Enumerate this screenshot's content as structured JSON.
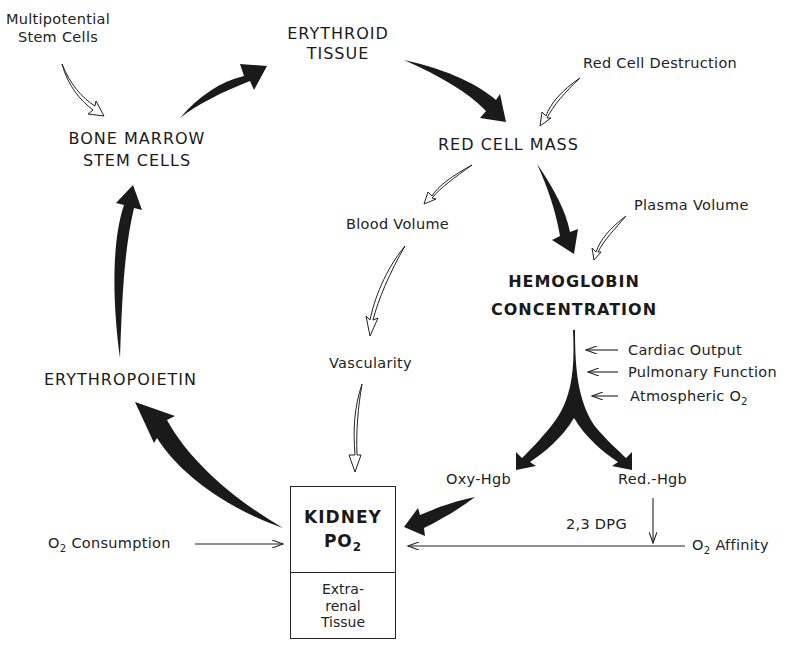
{
  "diagram": {
    "type": "erythropoiesis regulation feedback loop",
    "nodes": {
      "multipotential_stem_cells": [
        "Multipotential",
        "Stem Cells"
      ],
      "erythroid_tissue": [
        "ERYTHROID",
        "TISSUE"
      ],
      "bone_marrow_stem_cells": [
        "BONE MARROW",
        "STEM CELLS"
      ],
      "red_cell_destruction": "Red Cell Destruction",
      "red_cell_mass": "RED CELL MASS",
      "blood_volume": "Blood Volume",
      "plasma_volume": "Plasma Volume",
      "hemoglobin_concentration": [
        "HEMOGLOBIN",
        "CONCENTRATION"
      ],
      "vascularity": "Vascularity",
      "erythropoietin": "ERYTHROPOIETIN",
      "cardiac_output": "Cardiac Output",
      "pulmonary_function": "Pulmonary Function",
      "atmospheric_o2": {
        "text": "Atmospheric O",
        "sub": "2"
      },
      "oxy_hgb": "Oxy-Hgb",
      "red_hgb": "Red.-Hgb",
      "dpg": "2,3 DPG",
      "o2_consumption": {
        "prefix": "O",
        "sub": "2",
        "text": " Consumption"
      },
      "o2_affinity": {
        "prefix": "O",
        "sub": "2",
        "text": " Affinity"
      },
      "kidney_box": {
        "top_line1": "KIDNEY",
        "top_line2": {
          "text": "PO",
          "sub": "2"
        },
        "bottom": [
          "Extra-",
          "renal",
          "Tissue"
        ]
      }
    },
    "edges": [
      {
        "from": "Bone Marrow Stem Cells",
        "to": "Erythroid Tissue",
        "style": "solid-major"
      },
      {
        "from": "Erythroid Tissue",
        "to": "Red Cell Mass",
        "style": "solid-major"
      },
      {
        "from": "Red Cell Mass",
        "to": "Hemoglobin Concentration",
        "style": "solid-major"
      },
      {
        "from": "Hemoglobin Concentration",
        "to": "Oxy-Hgb",
        "style": "solid-major"
      },
      {
        "from": "Hemoglobin Concentration",
        "to": "Red.-Hgb",
        "style": "solid-major"
      },
      {
        "from": "Oxy-Hgb",
        "to": "Kidney PO2",
        "style": "solid-major"
      },
      {
        "from": "Kidney PO2",
        "to": "Erythropoietin",
        "style": "solid-major"
      },
      {
        "from": "Erythropoietin",
        "to": "Bone Marrow Stem Cells",
        "style": "solid-major"
      },
      {
        "from": "Multipotential Stem Cells",
        "to": "Bone Marrow Stem Cells",
        "style": "hollow"
      },
      {
        "from": "Red Cell Destruction",
        "to": "Red Cell Mass",
        "style": "hollow"
      },
      {
        "from": "Red Cell Mass",
        "to": "Blood Volume",
        "style": "hollow"
      },
      {
        "from": "Plasma Volume",
        "to": "Hemoglobin Concentration",
        "style": "hollow"
      },
      {
        "from": "Blood Volume",
        "to": "Vascularity",
        "style": "hollow"
      },
      {
        "from": "Vascularity",
        "to": "Kidney PO2",
        "style": "hollow"
      },
      {
        "from": "Cardiac Output",
        "to": "Hemoglobin stem",
        "style": "thin"
      },
      {
        "from": "Pulmonary Function",
        "to": "Hemoglobin stem",
        "style": "thin"
      },
      {
        "from": "Atmospheric O2",
        "to": "Hemoglobin stem",
        "style": "thin"
      },
      {
        "from": "Red.-Hgb",
        "to": "O2 Affinity line",
        "label": "2,3 DPG",
        "style": "thin"
      },
      {
        "from": "O2 Affinity",
        "to": "Kidney PO2",
        "style": "thin"
      },
      {
        "from": "O2 Consumption",
        "to": "Kidney PO2",
        "style": "thin"
      }
    ]
  }
}
